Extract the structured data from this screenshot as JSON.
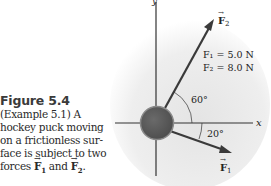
{
  "figure": {
    "number_label": "Figure 5.4",
    "caption_lines": [
      "(Example 5.1) A",
      "hockey puck moving",
      "on a frictionless sur-",
      "face is subject to two"
    ],
    "caption_last_prefix": "forces",
    "caption_last_vec1": "F",
    "caption_last_vec1_sub": "1",
    "caption_last_and": "and",
    "caption_last_vec2": "F",
    "caption_last_vec2_sub": "2",
    "caption_last_suffix": "."
  },
  "diagram": {
    "axis_x_label": "x",
    "axis_y_label": "y",
    "vector_F1_label": "F",
    "vector_F1_sub": "1",
    "vector_F2_label": "F",
    "vector_F2_sub": "2",
    "F1_value": "F₁ = 5.0 N",
    "F2_value": "F₂ = 8.0 N",
    "angle_F2": "60°",
    "angle_F1": "20°",
    "colors": {
      "background_shade": "#e9e9e9",
      "axis": "#333333",
      "arrow": "#3a3a3a",
      "puck": "#5a5a5a",
      "puck_rim": "#8a8a8a"
    }
  }
}
